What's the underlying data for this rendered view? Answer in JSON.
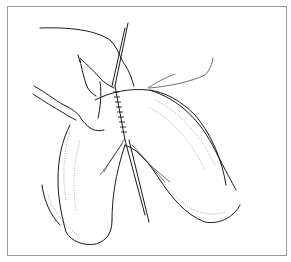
{
  "figure": {
    "colors": {
      "line": "#1a1a1a",
      "border": "#9a9a9a",
      "background": "#ffffff"
    }
  }
}
